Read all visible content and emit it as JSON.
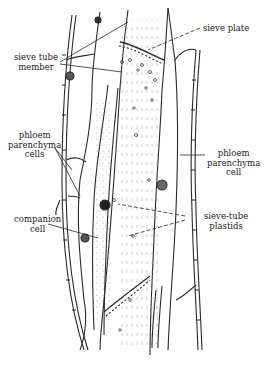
{
  "figure": {
    "labels": {
      "sieve_plate": "sieve plate",
      "sieve_tube_member_1": "sieve tube",
      "sieve_tube_member_2": "member",
      "phloem_parenchyma_cells_1": "phloem",
      "phloem_parenchyma_cells_2": "parenchyma",
      "phloem_parenchyma_cells_3": "cells",
      "phloem_parenchyma_cell_1": "phloem",
      "phloem_parenchyma_cell_2": "parenchyma",
      "phloem_parenchyma_cell_3": "cell",
      "companion_cell_1": "companion",
      "companion_cell_2": "cell",
      "sieve_tube_plastids_1": "sieve-tube",
      "sieve_tube_plastids_2": "plastids"
    },
    "colors": {
      "ink": "#2a2a2a",
      "stipple": "#8a8a8a",
      "background": "#ffffff"
    }
  }
}
